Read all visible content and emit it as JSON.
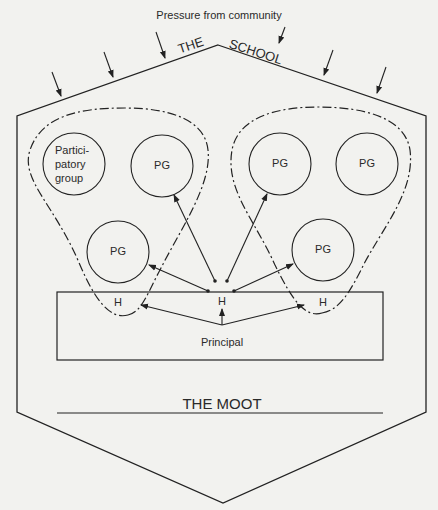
{
  "diagram": {
    "top_label": "Pressure from community",
    "school_title_left": "THE",
    "school_title_right": "SCHOOL",
    "moot_label": "THE MOOT",
    "principal_label": "Principal",
    "participatory_group_label_lines": [
      "Partici-",
      "patory",
      "group"
    ],
    "pg_label": "PG",
    "head_label": "H",
    "colors": {
      "background": "#f2f2ef",
      "stroke": "#222222",
      "text": "#2a2a2a"
    }
  }
}
